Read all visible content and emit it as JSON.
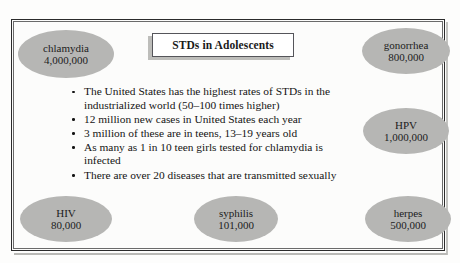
{
  "title_box": {
    "text": "STDs in Adolescents"
  },
  "bullets": [
    "The United States has the highest rates of STDs in the industrialized world (50–100 times higher)",
    "12 million new cases in United States each year",
    "3 million of these are in teens, 13–19 years old",
    "As many as 1 in 10 teen girls tested for chlamydia is infected",
    "There are over 20 diseases that are transmitted sexually"
  ],
  "ellipses": [
    {
      "name": "chlamydia",
      "value": "4,000,000"
    },
    {
      "name": "gonorrhea",
      "value": "800,000"
    },
    {
      "name": "HPV",
      "value": "1,000,000"
    },
    {
      "name": "HIV",
      "value": "80,000"
    },
    {
      "name": "syphilis",
      "value": "101,000"
    },
    {
      "name": "herpes",
      "value": "500,000"
    }
  ],
  "colors": {
    "ellipse_fill": "#b6b6b4",
    "frame_line": "#2b2b2b",
    "text": "#141414",
    "title_box_bg": "#ffffff",
    "shadow": "#bdbdba"
  }
}
